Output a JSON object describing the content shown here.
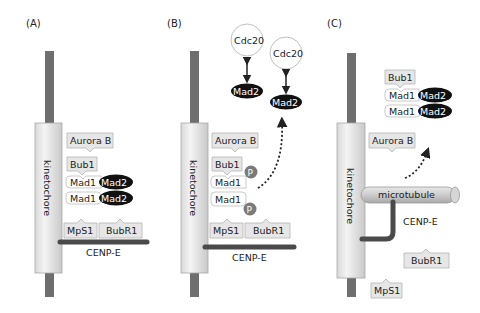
{
  "panels": {
    "A": {
      "label": "(A)",
      "kinetochore": "kinetochore",
      "aurora_b": "Aurora B",
      "bub1": "Bub1",
      "mad1_top": "Mad1",
      "mad2_top": "Mad2",
      "mad1_bottom": "Mad1",
      "mad2_bottom": "Mad2",
      "mps1": "MpS1",
      "bubr1": "BubR1",
      "cenp_e": "CENP-E"
    },
    "B": {
      "label": "(B)",
      "kinetochore": "kinetochore",
      "aurora_b": "Aurora B",
      "bub1": "Bub1",
      "mad1_top": "Mad1",
      "mad1_bottom": "Mad1",
      "phospho_top": "P",
      "phospho_bottom": "P",
      "cdc20_left": "Cdc20",
      "mad2_left": "Mad2",
      "cdc20_right": "Cdc20",
      "mad2_right": "Mad2",
      "mps1": "MpS1",
      "bubr1": "BubR1",
      "cenp_e": "CENP-E"
    },
    "C": {
      "label": "(C)",
      "kinetochore": "kinetochore",
      "bub1": "Bub1",
      "mad1_top": "Mad1",
      "mad2_top": "Mad2",
      "mad1_bottom": "Mad1",
      "mad2_bottom": "Mad2",
      "aurora_b": "Aurora B",
      "microtubule": "microtubule",
      "cenp_e": "CENP-E",
      "bubr1": "BubR1",
      "mps1": "MpS1"
    }
  },
  "colors": {
    "rod": "#6e6e6e",
    "mad2": "#111111",
    "phospho": "#7a7a7a",
    "cenp_e": "#4a4a4a",
    "protein_box": "#e6e6e6"
  }
}
